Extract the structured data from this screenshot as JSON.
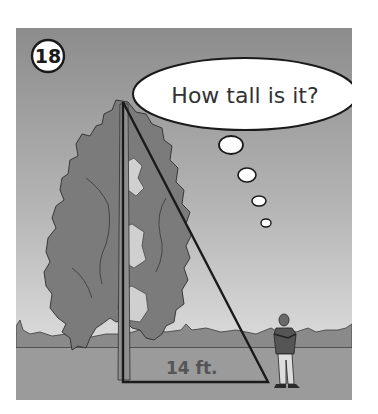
{
  "problem": {
    "number": "18"
  },
  "thought_bubble": {
    "text": "How tall is it?"
  },
  "measurement": {
    "base_label": "14 ft."
  },
  "scene": {
    "subjects": [
      "tree",
      "person",
      "right-triangle"
    ],
    "colors": {
      "sky_top": "#8c8c8c",
      "sky_bottom": "#dcdcdc",
      "ground": "#9b9b9b",
      "hills": "#8a8a8a",
      "tree": "#7b7b7b",
      "tree_gaps": "#d0d0d0",
      "line": "#1a1a1a",
      "bubble": "#ffffff",
      "label": "#555555"
    }
  }
}
